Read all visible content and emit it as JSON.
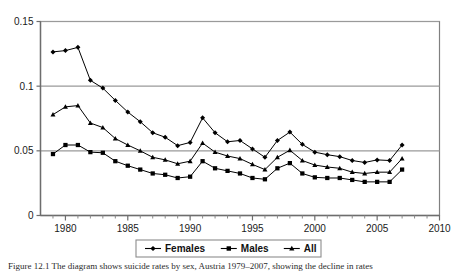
{
  "figure": {
    "caption_prefix": "Figure 12.1",
    "caption_text": "Figure 12.1  The diagram shows suicide rates by sex, Austria 1979–2007, showing the decline in rates"
  },
  "legend": {
    "position": "bottom-center",
    "entries": [
      {
        "label": "Females",
        "marker": "diamond",
        "color": "#000000"
      },
      {
        "label": "Males",
        "marker": "square",
        "color": "#000000"
      },
      {
        "label": "All",
        "marker": "triangle",
        "color": "#000000"
      }
    ]
  },
  "chart_data": {
    "type": "line",
    "title": "",
    "xlabel": "",
    "ylabel": "",
    "xlim": [
      1978,
      2010
    ],
    "ylim": [
      0,
      0.15
    ],
    "grid": "horizontal",
    "y_ticks": [
      0,
      0.05,
      0.1,
      0.15
    ],
    "y_tick_labels": [
      "0",
      "0.05",
      "0.1",
      "0.15"
    ],
    "x_ticks": [
      1980,
      1985,
      1990,
      1995,
      2000,
      2005,
      2010
    ],
    "x_tick_labels": [
      "1980",
      "1985",
      "1990",
      "1995",
      "2000",
      "2005",
      "2010"
    ],
    "x_minor_ticks": [
      1979,
      1981,
      1982,
      1983,
      1984,
      1986,
      1987,
      1988,
      1989,
      1991,
      1992,
      1993,
      1994,
      1996,
      1997,
      1998,
      1999,
      2001,
      2002,
      2003,
      2004,
      2006,
      2007,
      2008,
      2009
    ],
    "x": [
      1979,
      1980,
      1981,
      1982,
      1983,
      1984,
      1985,
      1986,
      1987,
      1988,
      1989,
      1990,
      1991,
      1992,
      1993,
      1994,
      1995,
      1996,
      1997,
      1998,
      1999,
      2000,
      2001,
      2002,
      2003,
      2004,
      2005,
      2006,
      2007
    ],
    "series": [
      {
        "name": "Females",
        "marker": "diamond",
        "color": "#000000",
        "values": [
          0.1265,
          0.1275,
          0.13,
          0.1045,
          0.0985,
          0.089,
          0.08,
          0.0725,
          0.064,
          0.0605,
          0.054,
          0.0565,
          0.0755,
          0.064,
          0.057,
          0.058,
          0.0515,
          0.045,
          0.058,
          0.0645,
          0.055,
          0.049,
          0.047,
          0.0455,
          0.0425,
          0.041,
          0.043,
          0.0425,
          0.0545
        ]
      },
      {
        "name": "Males",
        "marker": "square",
        "color": "#000000",
        "values": [
          0.0475,
          0.0545,
          0.0545,
          0.049,
          0.0485,
          0.042,
          0.0385,
          0.0355,
          0.0325,
          0.0315,
          0.029,
          0.03,
          0.042,
          0.0365,
          0.0345,
          0.0325,
          0.029,
          0.028,
          0.0365,
          0.0405,
          0.0325,
          0.0295,
          0.029,
          0.029,
          0.0275,
          0.026,
          0.026,
          0.026,
          0.0355
        ]
      },
      {
        "name": "All",
        "marker": "triangle",
        "color": "#000000",
        "values": [
          0.078,
          0.084,
          0.085,
          0.0715,
          0.068,
          0.0595,
          0.0545,
          0.05,
          0.045,
          0.043,
          0.04,
          0.042,
          0.056,
          0.049,
          0.046,
          0.044,
          0.0395,
          0.0355,
          0.045,
          0.0505,
          0.0425,
          0.039,
          0.0375,
          0.0365,
          0.0335,
          0.0325,
          0.0335,
          0.0335,
          0.044
        ]
      }
    ]
  }
}
